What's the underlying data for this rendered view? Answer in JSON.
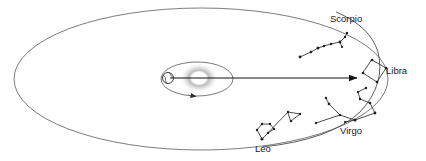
{
  "diagram": {
    "background_color": "#ffffff",
    "line_color": "#4a4a4a",
    "star_color": "#1d1d1d",
    "text_color": "#1a1a1a",
    "width": 426,
    "height": 161
  },
  "earth_orbit": {
    "name": "earth-orbit-ellipse",
    "cx": 201,
    "cy": 79,
    "rx": 187,
    "ry": 71,
    "stroke": "#5a5a5a"
  },
  "moon_orbit": {
    "name": "moon-orbit-ellipse",
    "cx": 197,
    "cy": 79,
    "rx": 36,
    "ry": 17,
    "stroke": "#6a6a6a",
    "direction_arrow_label": "counterclockwise"
  },
  "sun": {
    "name": "sun",
    "cx": 199,
    "cy": 78,
    "r": 7,
    "glow_color": "#b8b8b8"
  },
  "earth": {
    "name": "earth-globe",
    "cx": 168,
    "cy": 78,
    "r": 5.5
  },
  "sight_line": {
    "name": "line-of-sight-arrow",
    "x1": 169,
    "y1": 78,
    "x2": 358,
    "y2": 78,
    "points_to": "Libra"
  },
  "zodiac_arc": {
    "name": "zodiac-band-arc",
    "path": "M 262 147 Q 330 140 360 112 Q 386 84 378 52 Q 370 26 336 12"
  },
  "constellations": [
    {
      "id": "scorpio",
      "label": "Scorpio",
      "label_x": 330,
      "label_y": 22,
      "star_count": 9,
      "stars": [
        [
          300,
          57
        ],
        [
          311,
          52
        ],
        [
          318,
          48
        ],
        [
          324,
          46
        ],
        [
          331,
          44
        ],
        [
          340,
          42
        ],
        [
          345,
          37
        ],
        [
          347,
          33
        ],
        [
          342,
          47
        ]
      ],
      "links": [
        [
          [
            300,
            57
          ],
          [
            311,
            52
          ]
        ],
        [
          [
            311,
            52
          ],
          [
            318,
            48
          ]
        ],
        [
          [
            318,
            48
          ],
          [
            324,
            46
          ]
        ],
        [
          [
            324,
            46
          ],
          [
            331,
            44
          ]
        ],
        [
          [
            331,
            44
          ],
          [
            340,
            42
          ]
        ],
        [
          [
            340,
            42
          ],
          [
            345,
            37
          ]
        ],
        [
          [
            345,
            37
          ],
          [
            347,
            33
          ]
        ],
        [
          [
            340,
            42
          ],
          [
            342,
            47
          ]
        ]
      ]
    },
    {
      "id": "libra",
      "label": "Libra",
      "label_x": 386,
      "label_y": 74,
      "star_count": 4,
      "stars": [
        [
          372,
          60
        ],
        [
          386,
          68
        ],
        [
          377,
          82
        ],
        [
          363,
          73
        ]
      ],
      "links": [
        [
          [
            372,
            60
          ],
          [
            386,
            68
          ]
        ],
        [
          [
            386,
            68
          ],
          [
            377,
            82
          ]
        ],
        [
          [
            377,
            82
          ],
          [
            363,
            73
          ]
        ],
        [
          [
            363,
            73
          ],
          [
            372,
            60
          ]
        ]
      ]
    },
    {
      "id": "virgo",
      "label": "Virgo",
      "label_x": 340,
      "label_y": 134,
      "star_count": 10,
      "stars": [
        [
          366,
          88
        ],
        [
          358,
          92
        ],
        [
          360,
          99
        ],
        [
          370,
          103
        ],
        [
          375,
          113
        ],
        [
          355,
          120
        ],
        [
          340,
          115
        ],
        [
          329,
          104
        ],
        [
          326,
          98
        ],
        [
          316,
          123
        ]
      ],
      "links": [
        [
          [
            366,
            88
          ],
          [
            358,
            92
          ]
        ],
        [
          [
            358,
            92
          ],
          [
            360,
            99
          ]
        ],
        [
          [
            360,
            99
          ],
          [
            370,
            103
          ]
        ],
        [
          [
            370,
            103
          ],
          [
            375,
            113
          ]
        ],
        [
          [
            375,
            113
          ],
          [
            355,
            120
          ]
        ],
        [
          [
            355,
            120
          ],
          [
            340,
            115
          ]
        ],
        [
          [
            340,
            115
          ],
          [
            329,
            104
          ]
        ],
        [
          [
            329,
            104
          ],
          [
            326,
            98
          ]
        ],
        [
          [
            340,
            115
          ],
          [
            316,
            123
          ]
        ]
      ]
    },
    {
      "id": "leo",
      "label": "Leo",
      "label_x": 255,
      "label_y": 152,
      "star_count": 9,
      "stars": [
        [
          262,
          139
        ],
        [
          257,
          130
        ],
        [
          262,
          124
        ],
        [
          270,
          124
        ],
        [
          274,
          129
        ],
        [
          268,
          133
        ],
        [
          288,
          112
        ],
        [
          300,
          114
        ],
        [
          291,
          121
        ]
      ],
      "links": [
        [
          [
            262,
            139
          ],
          [
            257,
            130
          ]
        ],
        [
          [
            257,
            130
          ],
          [
            262,
            124
          ]
        ],
        [
          [
            262,
            124
          ],
          [
            270,
            124
          ]
        ],
        [
          [
            270,
            124
          ],
          [
            274,
            129
          ]
        ],
        [
          [
            274,
            129
          ],
          [
            268,
            133
          ]
        ],
        [
          [
            262,
            139
          ],
          [
            288,
            112
          ]
        ],
        [
          [
            288,
            112
          ],
          [
            300,
            114
          ]
        ],
        [
          [
            300,
            114
          ],
          [
            291,
            121
          ]
        ],
        [
          [
            291,
            121
          ],
          [
            288,
            112
          ]
        ]
      ]
    }
  ]
}
